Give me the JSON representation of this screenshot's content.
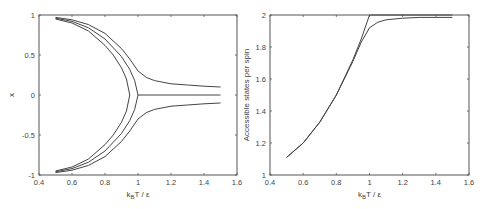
{
  "chart_data": [
    {
      "type": "line",
      "title": "",
      "xlabel": "k_B T / ε",
      "xlabel_parts": {
        "k": "k",
        "sub": "B",
        "rest": "T / ε"
      },
      "ylabel": "x",
      "xlim": [
        0.4,
        1.6
      ],
      "ylim": [
        -1,
        1
      ],
      "xticks": [
        "0.4",
        "0.6",
        "0.8",
        "1",
        "1.2",
        "1.4",
        "1.6"
      ],
      "yticks": [
        "-1",
        "-0.5",
        "0",
        "0.5",
        "1"
      ],
      "grid": false,
      "legend": null,
      "series": [
        {
          "name": "inner-branch-upper",
          "x": [
            0.5,
            0.6,
            0.7,
            0.8,
            0.85,
            0.9,
            0.93,
            0.95
          ],
          "y": [
            0.95,
            0.9,
            0.8,
            0.62,
            0.5,
            0.34,
            0.2,
            0.0
          ]
        },
        {
          "name": "inner-branch-lower",
          "x": [
            0.5,
            0.6,
            0.7,
            0.8,
            0.85,
            0.9,
            0.93,
            0.95
          ],
          "y": [
            -0.95,
            -0.9,
            -0.8,
            -0.62,
            -0.5,
            -0.34,
            -0.2,
            0.0
          ]
        },
        {
          "name": "middle-branch-upper",
          "x": [
            0.5,
            0.6,
            0.7,
            0.8,
            0.9,
            0.95,
            0.98,
            1.0
          ],
          "y": [
            0.96,
            0.92,
            0.84,
            0.7,
            0.48,
            0.32,
            0.18,
            0.0
          ]
        },
        {
          "name": "middle-branch-lower",
          "x": [
            0.5,
            0.6,
            0.7,
            0.8,
            0.9,
            0.95,
            0.98,
            1.0
          ],
          "y": [
            -0.96,
            -0.92,
            -0.84,
            -0.7,
            -0.48,
            -0.32,
            -0.18,
            0.0
          ]
        },
        {
          "name": "zero-line",
          "x": [
            1.0,
            1.5
          ],
          "y": [
            0.0,
            0.0
          ]
        },
        {
          "name": "field-branch-upper",
          "x": [
            0.5,
            0.6,
            0.7,
            0.8,
            0.9,
            0.95,
            1.0,
            1.05,
            1.1,
            1.2,
            1.3,
            1.4,
            1.5
          ],
          "y": [
            0.97,
            0.94,
            0.88,
            0.77,
            0.58,
            0.45,
            0.3,
            0.22,
            0.18,
            0.14,
            0.125,
            0.11,
            0.1
          ]
        },
        {
          "name": "field-branch-lower",
          "x": [
            0.5,
            0.6,
            0.7,
            0.8,
            0.9,
            0.95,
            1.0,
            1.05,
            1.1,
            1.2,
            1.3,
            1.4,
            1.5
          ],
          "y": [
            -0.97,
            -0.94,
            -0.88,
            -0.77,
            -0.58,
            -0.45,
            -0.3,
            -0.22,
            -0.18,
            -0.14,
            -0.125,
            -0.11,
            -0.1
          ]
        }
      ]
    },
    {
      "type": "line",
      "title": "",
      "xlabel": "k_B T / ε",
      "xlabel_parts": {
        "k": "k",
        "sub": "B",
        "rest": "T / ε"
      },
      "ylabel": "Accessible states per spin",
      "xlim": [
        0.4,
        1.6
      ],
      "ylim": [
        1,
        2
      ],
      "xticks": [
        "0.4",
        "0.6",
        "0.8",
        "1",
        "1.2",
        "1.4",
        "1.6"
      ],
      "yticks": [
        "1",
        "1.2",
        "1.4",
        "1.6",
        "1.8",
        "2"
      ],
      "grid": false,
      "legend": null,
      "series": [
        {
          "name": "zero-field",
          "x": [
            0.5,
            0.6,
            0.7,
            0.8,
            0.9,
            0.95,
            1.0,
            1.5
          ],
          "y": [
            1.11,
            1.2,
            1.33,
            1.5,
            1.72,
            1.85,
            2.0,
            2.0
          ]
        },
        {
          "name": "with-field",
          "x": [
            0.5,
            0.6,
            0.7,
            0.8,
            0.9,
            0.95,
            1.0,
            1.05,
            1.1,
            1.2,
            1.3,
            1.4,
            1.5
          ],
          "y": [
            1.11,
            1.2,
            1.33,
            1.5,
            1.71,
            1.83,
            1.92,
            1.955,
            1.97,
            1.98,
            1.985,
            1.985,
            1.985
          ]
        }
      ]
    }
  ]
}
